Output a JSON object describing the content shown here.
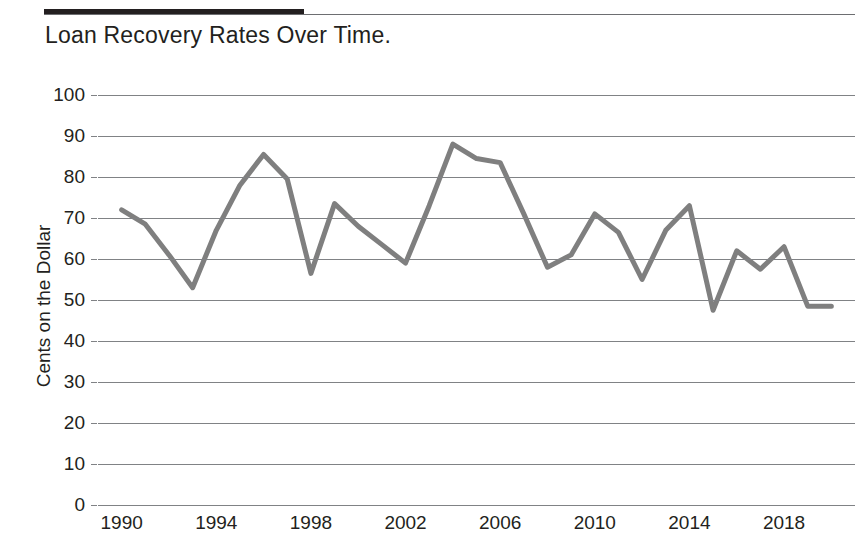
{
  "header": {
    "rule_color": "#231f20",
    "rule_thin_color": "#6d6e71"
  },
  "chart_data": {
    "type": "line",
    "title": "Loan Recovery Rates Over Time.",
    "xlabel": "",
    "ylabel": "Cents on the Dollar",
    "xlim": [
      1989,
      2021
    ],
    "ylim": [
      0,
      100
    ],
    "grid": true,
    "legend": false,
    "line_color": "#7f7f7f",
    "line_width": 5,
    "y_ticks": [
      100,
      90,
      80,
      70,
      60,
      50,
      40,
      30,
      20,
      10,
      0
    ],
    "y_tick_labels": [
      "100",
      "90",
      "80",
      "70",
      "60",
      "50",
      "40",
      "30",
      "20",
      "10",
      "0"
    ],
    "x_ticks": [
      1990,
      1994,
      1998,
      2002,
      2006,
      2010,
      2014,
      2018
    ],
    "x_tick_labels": [
      "1990",
      "1994",
      "1998",
      "2002",
      "2006",
      "2010",
      "2014",
      "2018"
    ],
    "x": [
      1990,
      1991,
      1992,
      1993,
      1994,
      1995,
      1996,
      1997,
      1998,
      1999,
      2000,
      2001,
      2002,
      2003,
      2004,
      2005,
      2006,
      2007,
      2008,
      2009,
      2010,
      2011,
      2012,
      2013,
      2014,
      2015,
      2016,
      2017,
      2018,
      2019,
      2020
    ],
    "values": [
      72,
      68.5,
      61,
      53,
      67,
      78,
      85.5,
      79.5,
      56.5,
      73.5,
      68,
      63.5,
      59,
      73,
      88,
      84.5,
      83.5,
      71,
      58,
      61,
      71,
      66.5,
      55,
      67,
      73,
      47.5,
      62,
      57.5,
      63,
      48.5,
      48.5
    ],
    "series_name": "Loan recovery rate"
  }
}
